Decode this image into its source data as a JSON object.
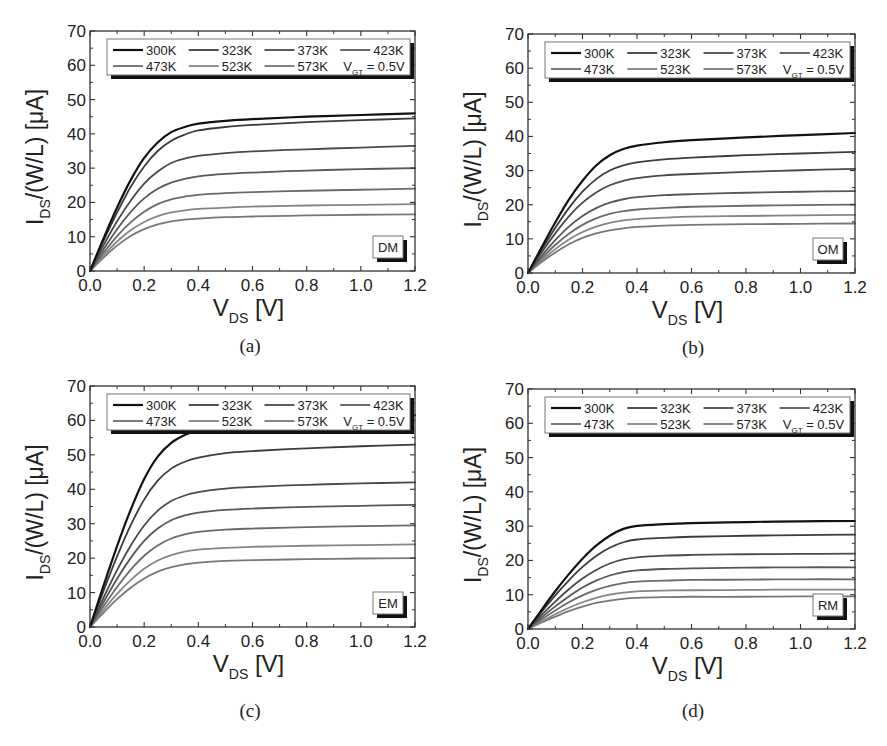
{
  "figure": {
    "y_axis_label_main": "I",
    "y_axis_label_sub": "DS",
    "y_axis_label_rest": "/(W/L) [μA]",
    "x_axis_label_main": "V",
    "x_axis_label_sub": "DS",
    "x_axis_label_rest": " [V]",
    "legend_note_main": "V",
    "legend_note_sub": "GT",
    "legend_note_rest": " = 0.5V",
    "x_ticks": [
      "0.0",
      "0.2",
      "0.4",
      "0.6",
      "0.8",
      "1.0",
      "1.2"
    ],
    "y_ticks": [
      "0",
      "10",
      "20",
      "30",
      "40",
      "50",
      "60",
      "70"
    ],
    "series_colors": [
      "#111111",
      "#3c3c3c",
      "#4a4a4a",
      "#575757",
      "#6a6a6a",
      "#858585",
      "#777777"
    ],
    "series_widths": [
      2.2,
      1.8,
      1.8,
      1.8,
      1.8,
      1.8,
      1.8
    ]
  },
  "chart_data": [
    {
      "type": "line",
      "panel": "(a)",
      "tag": "DM",
      "title": "",
      "xlabel": "V_DS [V]",
      "ylabel": "I_DS/(W/L) [μA]",
      "xlim": [
        0,
        1.2
      ],
      "ylim": [
        0,
        70
      ],
      "grid": false,
      "legend_position": "top",
      "legend_note": "V_GT = 0.5V",
      "x": [
        0.0,
        0.05,
        0.1,
        0.15,
        0.2,
        0.25,
        0.3,
        0.35,
        0.4,
        0.5,
        0.6,
        0.8,
        1.0,
        1.2
      ],
      "series": [
        {
          "name": "300K",
          "values": [
            0,
            9.5,
            18.5,
            26.5,
            33,
            37.5,
            40.5,
            42,
            43,
            43.8,
            44.3,
            45,
            45.5,
            46
          ]
        },
        {
          "name": "323K",
          "values": [
            0,
            8.8,
            17,
            24.5,
            30.5,
            35,
            38,
            39.8,
            41,
            42,
            42.6,
            43.4,
            44,
            44.5
          ]
        },
        {
          "name": "373K",
          "values": [
            0,
            7.5,
            14.5,
            20.5,
            25.5,
            29,
            31.5,
            32.8,
            33.6,
            34.4,
            34.9,
            35.5,
            36,
            36.5
          ]
        },
        {
          "name": "423K",
          "values": [
            0,
            6.3,
            12.2,
            17.2,
            21.2,
            24,
            25.8,
            26.9,
            27.6,
            28.3,
            28.7,
            29.3,
            29.7,
            30
          ]
        },
        {
          "name": "473K",
          "values": [
            0,
            5.3,
            10.2,
            14.2,
            17.3,
            19.5,
            20.9,
            21.7,
            22.2,
            22.7,
            23,
            23.4,
            23.7,
            24
          ]
        },
        {
          "name": "523K",
          "values": [
            0,
            4.5,
            8.6,
            11.9,
            14.3,
            16,
            17.1,
            17.7,
            18.1,
            18.5,
            18.8,
            19.1,
            19.3,
            19.5
          ]
        },
        {
          "name": "573K",
          "values": [
            0,
            3.9,
            7.4,
            10.2,
            12.2,
            13.6,
            14.5,
            15,
            15.3,
            15.7,
            15.9,
            16.2,
            16.4,
            16.5
          ]
        }
      ]
    },
    {
      "type": "line",
      "panel": "(b)",
      "tag": "OM",
      "title": "",
      "xlabel": "V_DS [V]",
      "ylabel": "I_DS/(W/L) [μA]",
      "xlim": [
        0,
        1.2
      ],
      "ylim": [
        0,
        70
      ],
      "grid": false,
      "legend_position": "top",
      "legend_note": "V_GT = 0.5V",
      "x": [
        0.0,
        0.05,
        0.1,
        0.15,
        0.2,
        0.25,
        0.3,
        0.35,
        0.4,
        0.5,
        0.6,
        0.8,
        1.0,
        1.2
      ],
      "series": [
        {
          "name": "300K",
          "values": [
            0,
            7.5,
            14.8,
            21.5,
            27,
            31.5,
            34.5,
            36.3,
            37.3,
            38.3,
            38.9,
            39.7,
            40.4,
            41
          ]
        },
        {
          "name": "323K",
          "values": [
            0,
            6.8,
            13.2,
            19,
            23.8,
            27.5,
            30,
            31.5,
            32.4,
            33.3,
            33.8,
            34.5,
            35,
            35.5
          ]
        },
        {
          "name": "373K",
          "values": [
            0,
            6,
            11.6,
            16.6,
            20.6,
            23.6,
            25.7,
            27,
            27.8,
            28.6,
            29,
            29.6,
            30.1,
            30.5
          ]
        },
        {
          "name": "423K",
          "values": [
            0,
            5,
            9.6,
            13.6,
            16.7,
            19,
            20.6,
            21.6,
            22.2,
            22.8,
            23.1,
            23.5,
            23.8,
            24
          ]
        },
        {
          "name": "473K",
          "values": [
            0,
            4.3,
            8.2,
            11.5,
            14.1,
            16,
            17.3,
            18.1,
            18.6,
            19.1,
            19.4,
            19.7,
            19.9,
            20
          ]
        },
        {
          "name": "523K",
          "values": [
            0,
            3.7,
            7,
            9.8,
            12,
            13.6,
            14.7,
            15.4,
            15.8,
            16.2,
            16.5,
            16.7,
            16.9,
            17
          ]
        },
        {
          "name": "573K",
          "values": [
            0,
            3.2,
            6,
            8.4,
            10.3,
            11.6,
            12.5,
            13.1,
            13.5,
            13.9,
            14.1,
            14.3,
            14.4,
            14.5
          ]
        }
      ]
    },
    {
      "type": "line",
      "panel": "(c)",
      "tag": "EM",
      "title": "",
      "xlabel": "V_DS [V]",
      "ylabel": "I_DS/(W/L) [μA]",
      "xlim": [
        0,
        1.2
      ],
      "ylim": [
        0,
        70
      ],
      "grid": false,
      "legend_position": "top",
      "legend_note": "V_GT = 0.5V",
      "x": [
        0.0,
        0.05,
        0.1,
        0.15,
        0.2,
        0.25,
        0.3,
        0.35,
        0.4,
        0.5,
        0.6,
        0.8,
        1.0,
        1.2
      ],
      "series": [
        {
          "name": "300K",
          "values": [
            0,
            12,
            23.5,
            34,
            43,
            49.5,
            53.5,
            55.8,
            57.2,
            58.6,
            59.3,
            60.2,
            60.9,
            61.5
          ]
        },
        {
          "name": "323K",
          "values": [
            0,
            10.5,
            20.5,
            29.5,
            37,
            42.5,
            46,
            48,
            49.2,
            50.5,
            51.1,
            51.9,
            52.5,
            53
          ]
        },
        {
          "name": "373K",
          "values": [
            0,
            8.5,
            16.5,
            23.6,
            29.5,
            33.8,
            36.6,
            38.2,
            39.2,
            40.2,
            40.7,
            41.3,
            41.7,
            42
          ]
        },
        {
          "name": "423K",
          "values": [
            0,
            7.2,
            14,
            20,
            25,
            28.6,
            31,
            32.4,
            33.2,
            34,
            34.4,
            34.9,
            35.2,
            35.5
          ]
        },
        {
          "name": "473K",
          "values": [
            0,
            6,
            11.6,
            16.6,
            20.7,
            23.7,
            25.7,
            26.9,
            27.6,
            28.3,
            28.6,
            29,
            29.3,
            29.5
          ]
        },
        {
          "name": "523K",
          "values": [
            0,
            5,
            9.6,
            13.6,
            16.9,
            19.3,
            20.9,
            21.9,
            22.5,
            23,
            23.3,
            23.6,
            23.8,
            24
          ]
        },
        {
          "name": "573K",
          "values": [
            0,
            4.2,
            8.1,
            11.4,
            14.1,
            16.1,
            17.4,
            18.2,
            18.7,
            19.2,
            19.4,
            19.7,
            19.9,
            20
          ]
        }
      ]
    },
    {
      "type": "line",
      "panel": "(d)",
      "tag": "RM",
      "title": "",
      "xlabel": "V_DS [V]",
      "ylabel": "I_DS/(W/L) [μA]",
      "xlim": [
        0,
        1.2
      ],
      "ylim": [
        0,
        70
      ],
      "grid": false,
      "legend_position": "top",
      "legend_note": "V_GT = 0.5V",
      "x": [
        0.0,
        0.05,
        0.1,
        0.15,
        0.2,
        0.25,
        0.3,
        0.35,
        0.4,
        0.5,
        0.6,
        0.8,
        1.0,
        1.2
      ],
      "series": [
        {
          "name": "300K",
          "values": [
            0,
            5.6,
            11,
            16,
            20.5,
            24.3,
            27.2,
            29.2,
            30.1,
            30.6,
            30.9,
            31.2,
            31.4,
            31.5
          ]
        },
        {
          "name": "323K",
          "values": [
            0,
            5,
            9.8,
            14.2,
            18.1,
            21.3,
            23.7,
            25.3,
            26.1,
            26.6,
            26.9,
            27.2,
            27.4,
            27.5
          ]
        },
        {
          "name": "373K",
          "values": [
            0,
            4.1,
            8,
            11.6,
            14.7,
            17.2,
            19.1,
            20.3,
            20.9,
            21.4,
            21.6,
            21.8,
            21.9,
            22
          ]
        },
        {
          "name": "423K",
          "values": [
            0,
            3.4,
            6.6,
            9.5,
            12.1,
            14.1,
            15.6,
            16.6,
            17.1,
            17.5,
            17.7,
            17.9,
            18,
            18
          ]
        },
        {
          "name": "473K",
          "values": [
            0,
            2.8,
            5.4,
            7.8,
            9.8,
            11.4,
            12.6,
            13.4,
            13.8,
            14.1,
            14.3,
            14.4,
            14.5,
            14.5
          ]
        },
        {
          "name": "523K",
          "values": [
            0,
            2.2,
            4.3,
            6.2,
            7.8,
            9.1,
            10,
            10.6,
            11,
            11.2,
            11.3,
            11.4,
            11.5,
            11.5
          ]
        },
        {
          "name": "573K",
          "values": [
            0,
            1.9,
            3.6,
            5.2,
            6.5,
            7.6,
            8.3,
            8.8,
            9.1,
            9.3,
            9.4,
            9.4,
            9.5,
            9.5
          ]
        }
      ]
    }
  ],
  "panels": [
    {
      "caption": "(a)",
      "tag": "DM"
    },
    {
      "caption": "(b)",
      "tag": "OM"
    },
    {
      "caption": "(c)",
      "tag": "EM"
    },
    {
      "caption": "(d)",
      "tag": "RM"
    }
  ]
}
